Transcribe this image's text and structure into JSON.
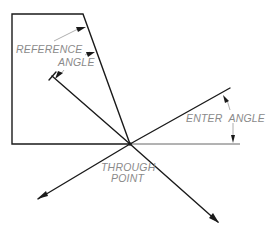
{
  "diagram": {
    "labels": {
      "reference_angle_line1": "REFERENCE",
      "reference_angle_line2": "ANGLE",
      "enter_angle": "ENTER  ANGLE",
      "through_point_line1": "THROUGH",
      "through_point_line2": "POINT"
    },
    "colors": {
      "line": "#1a1a1a",
      "label": "#8a8a8a",
      "background": "#ffffff"
    }
  }
}
